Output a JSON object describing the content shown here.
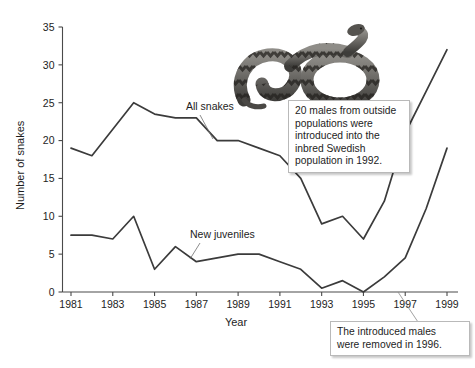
{
  "chart_data": {
    "type": "line",
    "title": "",
    "xlabel": "Year",
    "ylabel": "Number of snakes",
    "xlim": [
      1981,
      1999
    ],
    "ylim": [
      0,
      35
    ],
    "grid": false,
    "legend_position": "inline-labels",
    "x": [
      1981,
      1982,
      1983,
      1984,
      1985,
      1986,
      1987,
      1988,
      1989,
      1990,
      1991,
      1992,
      1993,
      1994,
      1995,
      1996,
      1997,
      1998,
      1999
    ],
    "xticks": [
      "1981",
      "1983",
      "1985",
      "1987",
      "1989",
      "1991",
      "1993",
      "1995",
      "1997",
      "1999"
    ],
    "yticks": [
      "0",
      "5",
      "10",
      "15",
      "20",
      "25",
      "30",
      "35"
    ],
    "series": [
      {
        "name": "All snakes",
        "values": [
          19,
          18,
          21.5,
          25,
          23.5,
          23,
          23,
          20,
          20,
          19,
          18,
          15,
          9,
          10,
          7,
          12,
          21,
          26.5,
          32
        ]
      },
      {
        "name": "New juveniles",
        "values": [
          7.5,
          7.5,
          7,
          10,
          3,
          6,
          4,
          4.5,
          5,
          5,
          4,
          3,
          0.5,
          1.5,
          0,
          2,
          4.5,
          11,
          19
        ]
      }
    ],
    "annotations": [
      {
        "id": "introduction",
        "text": "20 males from outside populations were introduced into the inbred Swedish population in 1992.",
        "points_to_year": 1992
      },
      {
        "id": "removal",
        "text": "The introduced males were removed in 1996.",
        "points_to_year": 1996
      }
    ]
  },
  "axes": {
    "ylabel": "Number of snakes",
    "xlabel": "Year",
    "yticks": [
      "0",
      "5",
      "10",
      "15",
      "20",
      "25",
      "30",
      "35"
    ],
    "xticks": [
      "1981",
      "1983",
      "1985",
      "1987",
      "1989",
      "1991",
      "1993",
      "1995",
      "1997",
      "1999"
    ]
  },
  "series_labels": {
    "all_snakes": "All snakes",
    "new_juveniles": "New juveniles"
  },
  "callouts": {
    "introduction": {
      "line1": "20 males from outside",
      "line2": "populations were",
      "line3": "introduced into the",
      "line4": "inbred Swedish",
      "line5": "population in 1992."
    },
    "removal": {
      "line1": "The introduced males",
      "line2": "were removed in 1996."
    }
  },
  "photo": {
    "caption": "adder-snake-photo"
  },
  "colors": {
    "line": "#3b3b3b",
    "axis": "#4a4a4a",
    "text": "#1d1d1d",
    "callout_border": "#b9b9b9",
    "background": "#ffffff"
  }
}
